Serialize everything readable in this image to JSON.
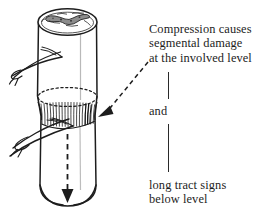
{
  "figure": {
    "background_color": "#ffffff",
    "ink_color": "#1d1d1d"
  },
  "illustration": {
    "name": "spinal-cord-cylinder",
    "parts": [
      {
        "name": "cord-cylinder-body",
        "description": "vertical cylinder representing the spinal cord"
      },
      {
        "name": "cord-top-cross-section",
        "description": "elliptical top face showing butterfly-shaped gray matter"
      },
      {
        "name": "gray-matter-butterfly",
        "description": "H-shaped central gray matter on the cut surface"
      },
      {
        "name": "nerve-root-upper",
        "description": "nerve root exiting the cord above the lesion"
      },
      {
        "name": "nerve-root-lower",
        "description": "nerve root exiting the cord at the lesion level"
      },
      {
        "name": "compression-band",
        "description": "hatched constricted band indicating the compressed segment"
      },
      {
        "name": "compression-dotted-ellipse",
        "description": "dotted ellipse marking the upper margin of compression"
      },
      {
        "name": "descending-tract-arrow",
        "description": "dashed arrow running down the cord below the level"
      },
      {
        "name": "pointer-dashed-arrow",
        "description": "dashed leader arrow from the caption to the compressed band"
      }
    ]
  },
  "captions": {
    "top": {
      "lines": [
        "Compression causes",
        "segmental damage",
        "at the involved level"
      ]
    },
    "middle": {
      "lines": [
        "and"
      ]
    },
    "bottom": {
      "lines": [
        "long tract signs",
        "below level"
      ]
    }
  },
  "connectors": {
    "upper_rule": "vertical-rule",
    "lower_rule": "vertical-rule"
  }
}
